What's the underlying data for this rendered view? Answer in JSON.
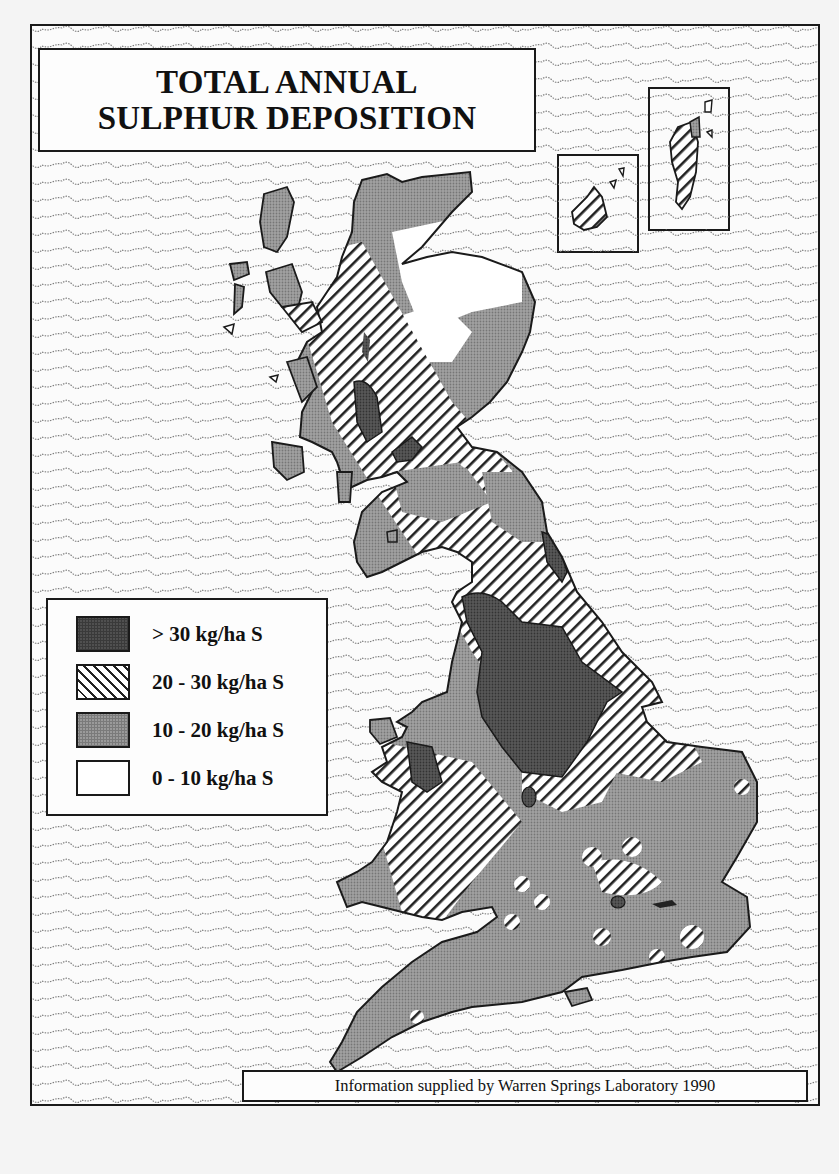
{
  "map": {
    "title_line1": "TOTAL ANNUAL",
    "title_line2": "SULPHUR DEPOSITION",
    "credit": "Information supplied by Warren Springs Laboratory 1990",
    "region": "Great Britain (with Orkney and Shetland insets)",
    "legend": {
      "items": [
        {
          "label": "> 30 kg/ha S",
          "fill": "dark-stipple",
          "color": "#505050"
        },
        {
          "label": "20 - 30 kg/ha S",
          "fill": "diagonal-hatch",
          "color": "#222222"
        },
        {
          "label": "10 - 20 kg/ha S",
          "fill": "grey-stipple",
          "color": "#9a9a9a"
        },
        {
          "label": "0 - 10 kg/ha S",
          "fill": "white",
          "color": "#ffffff"
        }
      ]
    },
    "insets": [
      {
        "name": "Orkney",
        "fill": "diagonal-hatch"
      },
      {
        "name": "Shetland",
        "fill": "diagonal-hatch"
      }
    ],
    "sea_fill": "wavy-line pattern",
    "colors": {
      "sea_wave": "#777777",
      "outline": "#1a1a1a",
      "dark": "#505050",
      "grey": "#9a9a9a",
      "paper": "#fbfbfb"
    }
  }
}
